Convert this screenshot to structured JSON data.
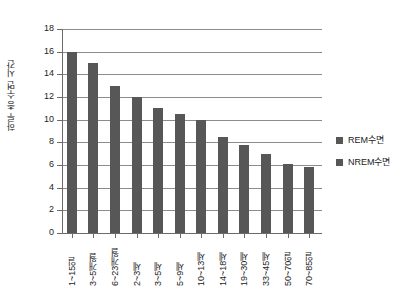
{
  "chart_data": {
    "type": "bar",
    "title": "",
    "xlabel": "",
    "ylabel": "하루 총 수면 시간",
    "ylim": [
      0,
      18
    ],
    "ytick_step": 2,
    "yticks": [
      "18",
      "16",
      "14",
      "12",
      "10",
      "8",
      "6",
      "4",
      "2",
      "0"
    ],
    "grid": true,
    "legend_position": "right",
    "categories": [
      "1~15일",
      "3~5개월",
      "6~23개월",
      "2~3세",
      "3~5세",
      "5~9세",
      "10~13세",
      "14~18세",
      "19~30세",
      "33~45세",
      "50~70일",
      "70~85일"
    ],
    "values": [
      16,
      15,
      13,
      12,
      11,
      10.5,
      10,
      8.5,
      7.8,
      7,
      6.1,
      5.8
    ],
    "series": [
      {
        "name": "REM수면",
        "color": "#575757"
      },
      {
        "name": "NREM수면",
        "color": "#575757"
      }
    ],
    "bar_color": "#575757",
    "grid_color": "#8c8c8c",
    "axis_color": "#6b6b6b",
    "background": "#ffffff"
  },
  "legend": {
    "items": [
      {
        "label": "REM수면",
        "color": "#575757"
      },
      {
        "label": "NREM수면",
        "color": "#575757"
      }
    ]
  }
}
